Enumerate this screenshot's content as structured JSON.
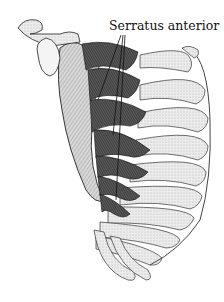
{
  "figure": {
    "labels": [
      {
        "text": "Serratus anterior",
        "x": 109,
        "y": 18
      }
    ],
    "colors": {
      "ink": "#111111",
      "muscle_dark": "#3a3a3a",
      "muscle_mid": "#6a6a6a",
      "bone": "#e8e8e8",
      "background": "#ffffff"
    }
  }
}
